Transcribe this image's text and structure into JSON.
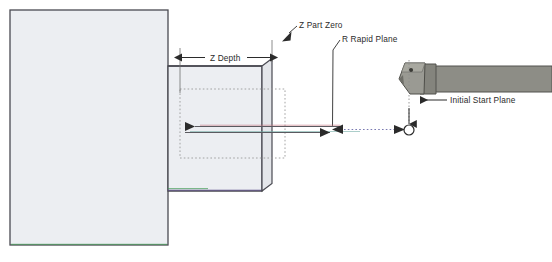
{
  "diagram": {
    "title_visible": false,
    "type": "cnc-lathe-boring-operation-diagram",
    "background_color": "#ffffff",
    "labels": {
      "z_depth": "Z Depth",
      "z_part_zero": "Z Part Zero",
      "r_rapid_plane": "R Rapid Plane",
      "initial_start_plane": "Initial Start Plane"
    },
    "colors": {
      "part_fill": "#eceef2",
      "part_outline": "#4a4a52",
      "tool_fill": "#8d8d86",
      "tool_outline": "#53534e",
      "insert_fill": "#9a9a93",
      "line_dark": "#2b2b2b",
      "line_red": "#c8737f",
      "line_teal": "#6fa9a2",
      "line_green": "#3f9a52",
      "dotted_gray": "#9a9a9a",
      "dotted_blue": "#6a6aa8"
    },
    "part": {
      "main_block": {
        "x": 10,
        "y": 10,
        "width": 158,
        "height": 235
      },
      "stepped_block": {
        "x": 168,
        "y": 66,
        "width": 101,
        "height": 125
      },
      "bore_outline": {
        "x": 180,
        "y": 89,
        "width": 105,
        "height": 69
      }
    },
    "tool": {
      "holder": {
        "x": 433,
        "y": 66,
        "width": 119,
        "height": 26
      },
      "insert_label": "cutting-insert"
    },
    "markers": {
      "rapid_plane_x": 332,
      "initial_start_plane_x": 409,
      "tool_tip_circle": {
        "cx": 409,
        "cy": 130,
        "r": 5
      }
    }
  }
}
